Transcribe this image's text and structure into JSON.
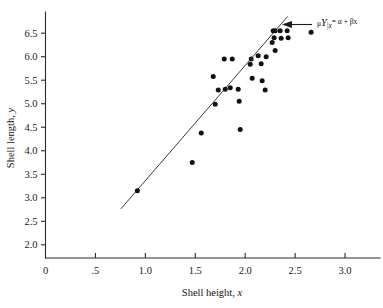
{
  "chart_data": {
    "type": "scatter",
    "title": "",
    "xlabel": "Shell height, x",
    "ylabel": "Shell length, y",
    "xlim": [
      0,
      3.35
    ],
    "ylim": [
      1.72,
      6.95
    ],
    "grid": false,
    "legend": "none",
    "x_ticks": [
      {
        "value": 0,
        "label": "0"
      },
      {
        "value": 0.5,
        "label": ".5"
      },
      {
        "value": 1.0,
        "label": "1.0"
      },
      {
        "value": 1.5,
        "label": "1.5"
      },
      {
        "value": 2.0,
        "label": "2.0"
      },
      {
        "value": 2.5,
        "label": "2.5"
      },
      {
        "value": 3.0,
        "label": "3.0"
      }
    ],
    "y_ticks": [
      {
        "value": 2.0,
        "label": "2.0"
      },
      {
        "value": 2.5,
        "label": "2.5"
      },
      {
        "value": 3.0,
        "label": "3.0"
      },
      {
        "value": 3.5,
        "label": "3.5"
      },
      {
        "value": 4.0,
        "label": "4.0"
      },
      {
        "value": 4.5,
        "label": "4.5"
      },
      {
        "value": 5.0,
        "label": "5.0"
      },
      {
        "value": 5.5,
        "label": "5.5"
      },
      {
        "value": 6.0,
        "label": "6.0"
      },
      {
        "value": 6.5,
        "label": "6.5"
      }
    ],
    "points": [
      {
        "x": 0.92,
        "y": 3.15
      },
      {
        "x": 1.47,
        "y": 3.75
      },
      {
        "x": 1.56,
        "y": 4.38
      },
      {
        "x": 1.68,
        "y": 5.58
      },
      {
        "x": 1.7,
        "y": 4.99
      },
      {
        "x": 1.73,
        "y": 5.29
      },
      {
        "x": 1.79,
        "y": 5.95
      },
      {
        "x": 1.8,
        "y": 5.31
      },
      {
        "x": 1.85,
        "y": 5.34
      },
      {
        "x": 1.87,
        "y": 5.95
      },
      {
        "x": 1.93,
        "y": 5.31
      },
      {
        "x": 1.94,
        "y": 5.05
      },
      {
        "x": 1.95,
        "y": 4.45
      },
      {
        "x": 2.05,
        "y": 5.84
      },
      {
        "x": 2.06,
        "y": 5.95
      },
      {
        "x": 2.07,
        "y": 5.54
      },
      {
        "x": 2.13,
        "y": 6.02
      },
      {
        "x": 2.16,
        "y": 5.85
      },
      {
        "x": 2.17,
        "y": 5.49
      },
      {
        "x": 2.2,
        "y": 5.29
      },
      {
        "x": 2.21,
        "y": 6.0
      },
      {
        "x": 2.27,
        "y": 6.3
      },
      {
        "x": 2.28,
        "y": 6.55
      },
      {
        "x": 2.29,
        "y": 6.4
      },
      {
        "x": 2.3,
        "y": 6.55
      },
      {
        "x": 2.3,
        "y": 6.13
      },
      {
        "x": 2.35,
        "y": 6.55
      },
      {
        "x": 2.36,
        "y": 6.39
      },
      {
        "x": 2.42,
        "y": 6.55
      },
      {
        "x": 2.43,
        "y": 6.4
      },
      {
        "x": 2.66,
        "y": 6.52
      }
    ],
    "regression_line": {
      "x_start": 0.755,
      "y_start": 2.765,
      "x_end": 2.425,
      "y_end": 6.855,
      "label_parts": {
        "mu": "μ",
        "subscript": "Y|x",
        "equation": " = α + βx"
      }
    },
    "annotation": {
      "arrow": "left-arrow-icon",
      "text_mu": "μ",
      "text_sub": "Y|x",
      "text_eq": "= α + βx"
    },
    "colors": {
      "point": "#111111",
      "line": "#3a3a3a",
      "axis": "#2b2b2b",
      "text": "#111111",
      "background": "#ffffff"
    }
  },
  "labels": {
    "x_axis_title_main": "Shell height, ",
    "x_axis_title_var": "x",
    "y_axis_title_main": "Shell length, ",
    "y_axis_title_var": "y"
  }
}
